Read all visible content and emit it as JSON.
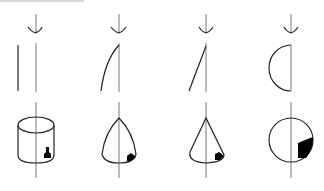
{
  "diagram": {
    "type": "solids-of-revolution",
    "columns": [
      {
        "id": "cylinder",
        "generator": "vertical-line",
        "solid": "cylinder"
      },
      {
        "id": "paraboloid-cone",
        "generator": "curved-line",
        "solid": "curved-cone"
      },
      {
        "id": "cone",
        "generator": "slanted-line",
        "solid": "cone"
      },
      {
        "id": "sphere",
        "generator": "semicircle",
        "solid": "sphere"
      }
    ],
    "colors": {
      "stroke": "#222222",
      "axis": "#555555",
      "fill": "#000000",
      "topbar": "#d8d8d8"
    }
  }
}
